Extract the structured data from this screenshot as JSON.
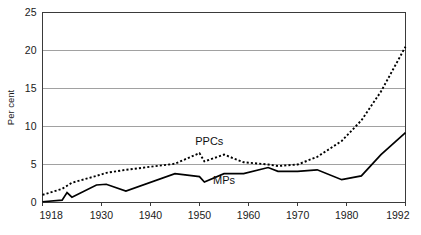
{
  "chart_data": {
    "type": "line",
    "title": "",
    "subtitle": "",
    "xlabel": "",
    "ylabel": "Per cent",
    "xlim": [
      1918,
      1992
    ],
    "ylim": [
      0,
      25
    ],
    "grid": "horizontal",
    "legend_position": "inline-annotations",
    "y_ticks": [
      "0",
      "5",
      "10",
      "15",
      "20",
      "25"
    ],
    "y_tick_values": [
      0,
      5,
      10,
      15,
      20,
      25
    ],
    "x_ticks": [
      "1918",
      "1930",
      "1940",
      "1950",
      "1960",
      "1970",
      "1980",
      "1992"
    ],
    "x_tick_values": [
      1918,
      1930,
      1940,
      1950,
      1960,
      1970,
      1980,
      1992
    ],
    "annotations": [
      {
        "text": "PPCs",
        "x": 1952,
        "y": 7.6
      },
      {
        "text": "MPs",
        "x": 1955,
        "y": 2.4
      }
    ],
    "series": [
      {
        "name": "PPCs",
        "style": "dotted",
        "color": "#000000",
        "x": [
          1918,
          1922,
          1923,
          1924,
          1929,
          1931,
          1935,
          1945,
          1950,
          1951,
          1955,
          1959,
          1964,
          1966,
          1970,
          1974,
          1979,
          1983,
          1987,
          1992
        ],
        "values": [
          1.0,
          1.8,
          2.2,
          2.6,
          3.5,
          3.9,
          4.3,
          5.1,
          6.5,
          5.4,
          6.3,
          5.3,
          5.0,
          4.8,
          5.0,
          6.0,
          8.1,
          10.8,
          14.6,
          20.5
        ]
      },
      {
        "name": "MPs",
        "style": "solid",
        "color": "#000000",
        "x": [
          1918,
          1922,
          1923,
          1924,
          1929,
          1931,
          1935,
          1945,
          1950,
          1951,
          1955,
          1959,
          1964,
          1966,
          1970,
          1974,
          1979,
          1983,
          1987,
          1992
        ],
        "values": [
          0.1,
          0.3,
          1.3,
          0.7,
          2.3,
          2.4,
          1.5,
          3.8,
          3.4,
          2.7,
          3.8,
          3.8,
          4.6,
          4.1,
          4.1,
          4.3,
          3.0,
          3.5,
          6.3,
          9.2
        ]
      }
    ]
  }
}
